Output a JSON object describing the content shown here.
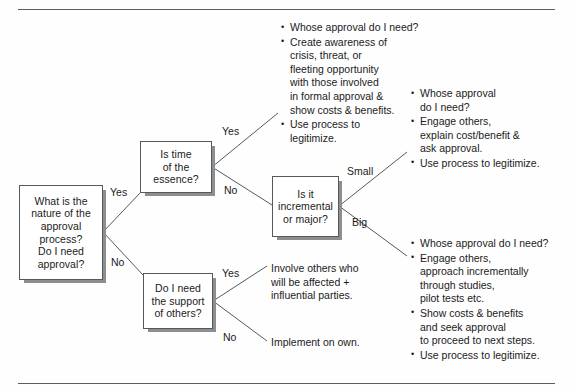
{
  "diagram": {
    "type": "decision-tree",
    "rules": {
      "top": "horizontal-rule",
      "bottom": "horizontal-rule"
    },
    "nodes": [
      {
        "id": "nature",
        "text": "What is the\nnature of the\napproval\nprocess?\nDo I need\napproval?"
      },
      {
        "id": "time",
        "text": "Is time\nof the\nessence?"
      },
      {
        "id": "support",
        "text": "Do I need\nthe support\nof others?"
      },
      {
        "id": "scale",
        "text": "Is it\nincremental\nor major?"
      }
    ],
    "edge_labels": {
      "nature_yes": "Yes",
      "nature_no": "No",
      "time_yes": "Yes",
      "time_no": "No",
      "scale_small": "Small",
      "scale_big": "Big",
      "support_yes": "Yes",
      "support_no": "No"
    },
    "outcomes": {
      "urgent": [
        "Whose approval do I need?",
        "Create awareness of\ncrisis, threat, or\nfleeting opportunity\nwith those involved\nin formal approval &\nshow costs & benefits.",
        "Use process to\nlegitimize."
      ],
      "small": [
        "Whose approval\ndo I need?",
        "Engage others,\nexplain cost/benefit &\nask approval.",
        "Use process to legitimize."
      ],
      "big": [
        "Whose approval do I need?",
        "Engage others,\napproach incrementally\nthrough studies,\npilot tests etc.",
        "Show costs & benefits\nand seek approval\nto proceed to next steps.",
        "Use process to legitimize."
      ],
      "involve": "Involve others who\nwill be affected +\ninfluential parties.",
      "implement": "Implement on own."
    },
    "colors": {
      "box_border": "#55595c",
      "box_shadow": "#8c8f92",
      "line": "#55595c",
      "text": "#1b1b1b",
      "rule": "#5c5c5c",
      "background": "#fefefe"
    }
  }
}
